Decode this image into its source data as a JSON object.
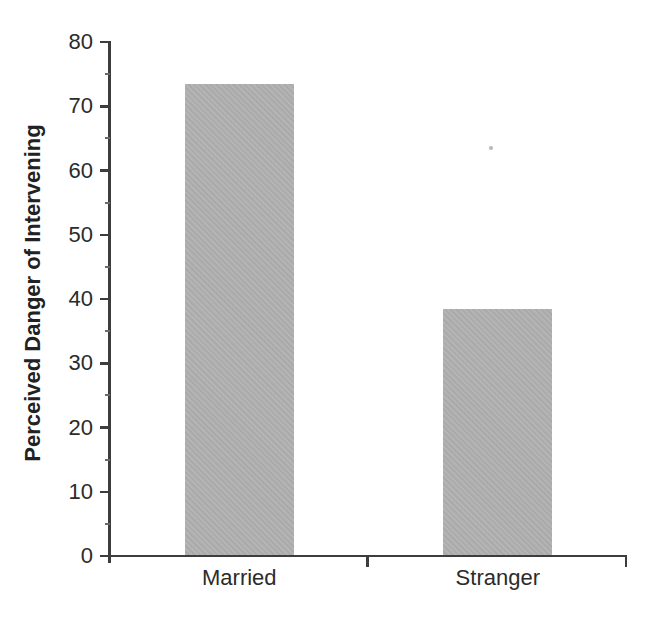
{
  "figure": {
    "background": "#ffffff"
  },
  "chart_data": {
    "type": "bar",
    "categories": [
      "Married",
      "Stranger"
    ],
    "values": [
      73.5,
      38.5
    ],
    "title": "",
    "xlabel": "",
    "ylabel": "Perceived Danger of Intervening",
    "ylim": [
      0,
      80
    ],
    "yticks": [
      0,
      10,
      20,
      30,
      40,
      50,
      60,
      70,
      80
    ],
    "minor_tick_interval": 5,
    "grid": false,
    "legend": null,
    "bar_color": "#b0b0b0",
    "axis_color": "#3d3d3d",
    "text_color": "#2b2b2b"
  }
}
